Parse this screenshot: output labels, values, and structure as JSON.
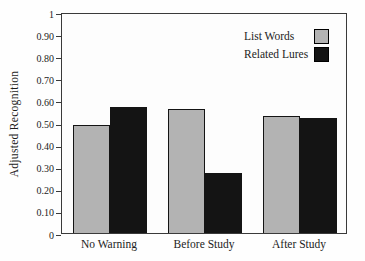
{
  "chart_data": {
    "type": "bar",
    "title": "",
    "xlabel": "",
    "ylabel": "Adjusted Recognition",
    "categories": [
      "No Warning",
      "Before Study",
      "After Study"
    ],
    "series": [
      {
        "name": "List Words",
        "color": "#b3b3b3",
        "values": [
          0.49,
          0.56,
          0.53
        ]
      },
      {
        "name": "Related Lures",
        "color": "#141414",
        "values": [
          0.57,
          0.27,
          0.52
        ]
      }
    ],
    "ylim": [
      0,
      1
    ],
    "y_ticks": [
      {
        "label": "1",
        "value": 1.0
      },
      {
        "label": "0.90",
        "value": 0.9
      },
      {
        "label": "0.80",
        "value": 0.8
      },
      {
        "label": "0.70",
        "value": 0.7
      },
      {
        "label": "0.60",
        "value": 0.6
      },
      {
        "label": "0.50",
        "value": 0.5
      },
      {
        "label": "0.40",
        "value": 0.4
      },
      {
        "label": "0.30",
        "value": 0.3
      },
      {
        "label": "0.20",
        "value": 0.2
      },
      {
        "label": "0.10",
        "value": 0.1
      },
      {
        "label": "0",
        "value": 0.0
      }
    ],
    "grid": false,
    "legend_position": "top-right-inside",
    "bar_width_px": 37
  }
}
